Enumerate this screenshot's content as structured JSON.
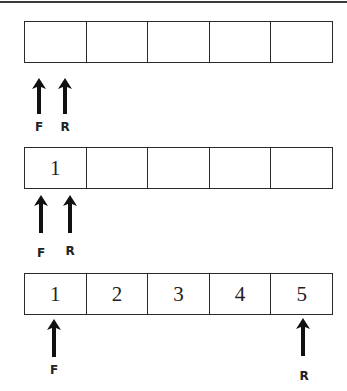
{
  "queues": [
    {
      "state": "empty",
      "cells": [
        "",
        "",
        "",
        "",
        ""
      ],
      "front_label": "F",
      "rear_label": "R"
    },
    {
      "state": "one element",
      "cells": [
        "1",
        "",
        "",
        "",
        ""
      ],
      "front_label": "F",
      "rear_label": "R"
    },
    {
      "state": "full",
      "cells": [
        "1",
        "2",
        "3",
        "4",
        "5"
      ],
      "front_label": "F",
      "rear_label": "R"
    }
  ],
  "colors": {
    "line": "#2a2a2a",
    "background": "#ffffff"
  }
}
